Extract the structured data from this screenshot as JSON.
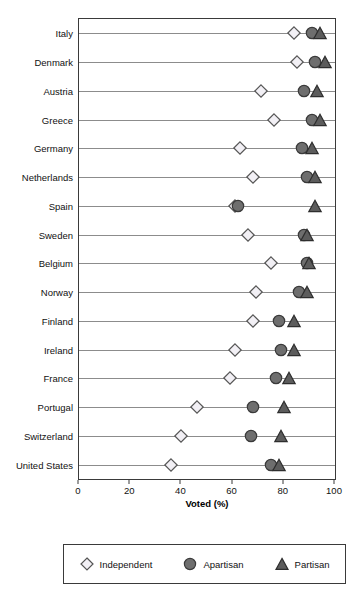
{
  "chart_data": {
    "type": "scatter",
    "title": "",
    "subtitle": "",
    "xlabel": "Voted (%)",
    "ylabel": "",
    "xlim": [
      0,
      100
    ],
    "xticks": [
      0,
      20,
      40,
      60,
      80,
      100
    ],
    "xticklabels": [
      "0",
      "20",
      "40",
      "60",
      "80",
      "100"
    ],
    "grid": false,
    "legend_position": "bottom",
    "categories": [
      "Italy",
      "Denmark",
      "Austria",
      "Greece",
      "Germany",
      "Netherlands",
      "Spain",
      "Sweden",
      "Belgium",
      "Norway",
      "Finland",
      "Ireland",
      "France",
      "Portugal",
      "Switzerland",
      "United States"
    ],
    "series": [
      {
        "name": "Independent",
        "marker": "diamond-open",
        "color": "#f2f0f5",
        "edge_color": "#555555",
        "values": [
          84,
          85,
          71,
          76,
          63,
          68,
          61,
          66,
          75,
          69,
          68,
          61,
          59,
          46,
          40,
          36
        ]
      },
      {
        "name": "Apartisan",
        "marker": "circle-filled",
        "color": "#6e6e6e",
        "edge_color": "#3a3a3a",
        "values": [
          91,
          92,
          88,
          91,
          87,
          89,
          62,
          88,
          89,
          86,
          78,
          79,
          77,
          68,
          67,
          75
        ]
      },
      {
        "name": "Partisan",
        "marker": "triangle-filled",
        "color": "#5c5c5c",
        "edge_color": "#2e2e2e",
        "values": [
          94,
          96,
          93,
          94,
          91,
          92,
          92,
          89,
          90,
          89,
          84,
          84,
          82,
          80,
          79,
          78
        ]
      }
    ]
  },
  "legend": {
    "items": [
      {
        "label": "Independent"
      },
      {
        "label": "Apartisan"
      },
      {
        "label": "Partisan"
      }
    ]
  }
}
